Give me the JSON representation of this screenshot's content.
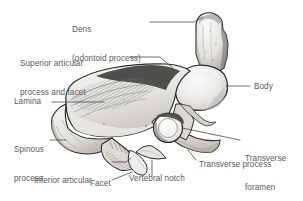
{
  "figure": {
    "background_color": "#ffffff",
    "text_color": "#5a5a5a",
    "line_color": "#4a4a4a",
    "bone_fill_light": "#f2f1ef",
    "bone_fill_mid": "#d8d6d2",
    "bone_fill_dark": "#9b9893",
    "bone_outline": "#2b2b2b"
  },
  "labels": {
    "dens_line1": "Dens",
    "dens_line2": "(odontoid process)",
    "superior_articular_line1": "Superior articular",
    "superior_articular_line2": "process and facet",
    "lamina": "Lamina",
    "spinous_line1": "Spinous",
    "spinous_line2": "process",
    "inferior_articular_line1": "Inferior articular",
    "inferior_articular_line2": "process",
    "facet": "Facet",
    "vertebral_notch": "Vertebral notch",
    "transverse_process": "Transverse process",
    "transverse_foramen_line1": "Transverse",
    "transverse_foramen_line2": "foramen",
    "body": "Body"
  },
  "structures": [
    {
      "name": "dens",
      "label": "Dens (odontoid process)",
      "position": "superior-posterior peg"
    },
    {
      "name": "superior-articular-process-and-facet",
      "label": "Superior articular process and facet",
      "position": "supero-lateral"
    },
    {
      "name": "lamina",
      "label": "Lamina",
      "position": "posterolateral plate"
    },
    {
      "name": "spinous-process",
      "label": "Spinous process",
      "position": "posterior projection"
    },
    {
      "name": "inferior-articular-process",
      "label": "Inferior articular process",
      "position": "infero-posterior"
    },
    {
      "name": "facet",
      "label": "Facet",
      "position": "inferior articular surface"
    },
    {
      "name": "vertebral-notch",
      "label": "Vertebral notch",
      "position": "inferior margin"
    },
    {
      "name": "transverse-process",
      "label": "Transverse process",
      "position": "lateral projection"
    },
    {
      "name": "transverse-foramen",
      "label": "Transverse foramen",
      "position": "within transverse process"
    },
    {
      "name": "body",
      "label": "Body",
      "position": "anterior mass"
    }
  ]
}
